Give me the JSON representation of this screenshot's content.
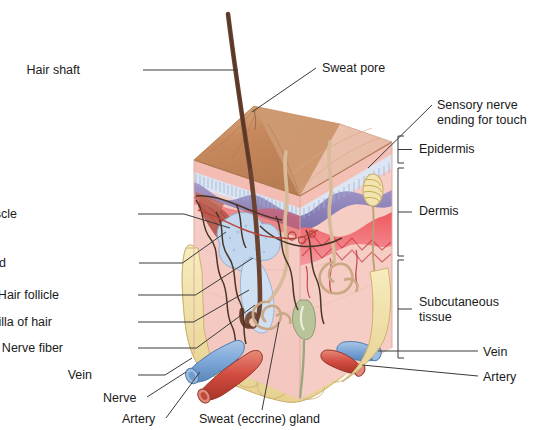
{
  "figure": {
    "title_visible": false
  },
  "labels_left": [
    {
      "name": "hair-shaft",
      "text": "Hair shaft",
      "x": 80,
      "y": 63,
      "lx": 143,
      "ly": 70,
      "tx": 238,
      "ty": 70
    },
    {
      "name": "arrector-pili-muscle",
      "text": "Arrector pili muscle",
      "x": 17,
      "y": 207,
      "lx": 138,
      "ly": 214,
      "tx": 230,
      "ty": 228
    },
    {
      "name": "sebaceous-oil-gland",
      "text": "Sebaceous (oil) gland",
      "x": 6,
      "y": 256,
      "lx": 139,
      "ly": 263,
      "tx": 226,
      "ty": 232
    },
    {
      "name": "hair-follicle",
      "text": "Hair follicle",
      "x": 59,
      "y": 288,
      "lx": 138,
      "ly": 295,
      "tx": 253,
      "ty": 258
    },
    {
      "name": "papilla-of-hair",
      "text": "Papilla of hair",
      "x": 52,
      "y": 315,
      "lx": 138,
      "ly": 322,
      "tx": 249,
      "ty": 290
    },
    {
      "name": "nerve-fiber",
      "text": "Nerve fiber",
      "x": 63,
      "y": 341,
      "lx": 138,
      "ly": 348,
      "tx": 255,
      "ty": 305
    },
    {
      "name": "vein-left",
      "text": "Vein",
      "x": 92,
      "y": 368,
      "lx": 138,
      "ly": 375,
      "tx": 192,
      "ty": 358
    }
  ],
  "labels_bottom": [
    {
      "name": "nerve",
      "text": "Nerve",
      "x": 103,
      "y": 391,
      "lx": 147,
      "ly": 397,
      "tx": 186,
      "ty": 372
    },
    {
      "name": "artery-bottom",
      "text": "Artery",
      "x": 122,
      "y": 412,
      "lx": 166,
      "ly": 418,
      "tx": 200,
      "ty": 372
    },
    {
      "name": "sweat-eccrine-gland",
      "text": "Sweat (eccrine) gland",
      "x": 199,
      "y": 412,
      "lx": 262,
      "ly": 410,
      "tx": 279,
      "ty": 322
    }
  ],
  "labels_top": [
    {
      "name": "sweat-pore",
      "text": "Sweat pore",
      "x": 322,
      "y": 61,
      "lx": 316,
      "ly": 68,
      "tx": 252,
      "ty": 112
    }
  ],
  "labels_right": [
    {
      "name": "sensory-nerve-ending-for-touch",
      "line1": "Sensory nerve",
      "line2": "ending for touch",
      "x": 437,
      "y": 98,
      "lx": 432,
      "ly": 105,
      "tx": 368,
      "ty": 168
    },
    {
      "name": "vein-right",
      "text": "Vein",
      "x": 483,
      "y": 345,
      "lx": 478,
      "ly": 351,
      "tx": 378,
      "ty": 351
    },
    {
      "name": "artery-right",
      "text": "Artery",
      "x": 483,
      "y": 370,
      "lx": 478,
      "ly": 376,
      "tx": 362,
      "ty": 365
    }
  ],
  "brackets": [
    {
      "name": "epidermis",
      "text": "Epidermis",
      "x": 419,
      "y": 144,
      "top": 136,
      "bottom": 163,
      "tick_x": 412,
      "label_y": 144
    },
    {
      "name": "dermis",
      "text": "Dermis",
      "x": 419,
      "y": 199,
      "top": 168,
      "bottom": 256,
      "tick_x": 412,
      "label_y": 199
    },
    {
      "name": "subcutaneous-tissue",
      "line1": "Subcutaneous",
      "line2": "tissue",
      "x": 419,
      "y": 276,
      "top": 260,
      "bottom": 358,
      "tick_x": 412,
      "label_y": 276
    }
  ],
  "colors": {
    "surface_top": "#c98f63",
    "surface_top_light": "#ddb08a",
    "epidermis_pink": "#f0bfb4",
    "stratum_granulosum": "#d9e2f2",
    "basal_purple": "#8d83bb",
    "dermis_pink": "#f2c4bd",
    "dermis_pale": "#f6d2cb",
    "vascular_red": "#e8464f",
    "vascular_red_light": "#f0878c",
    "fat_yellow": "#f2e2a8",
    "fat_yellow_dark": "#e3cd86",
    "vein_blue": "#7da7d9",
    "artery_red": "#d14a3f",
    "hair_brown": "#6b4330",
    "muscle_red": "#b55548",
    "gland_blue": "#c3d8ef",
    "duct_tan": "#e2c9ad",
    "nerve_dark": "#4a3526",
    "sweat_gland_green": "#b9c49a",
    "leader_line": "#3a3a3a",
    "text": "#1a1a1a"
  }
}
